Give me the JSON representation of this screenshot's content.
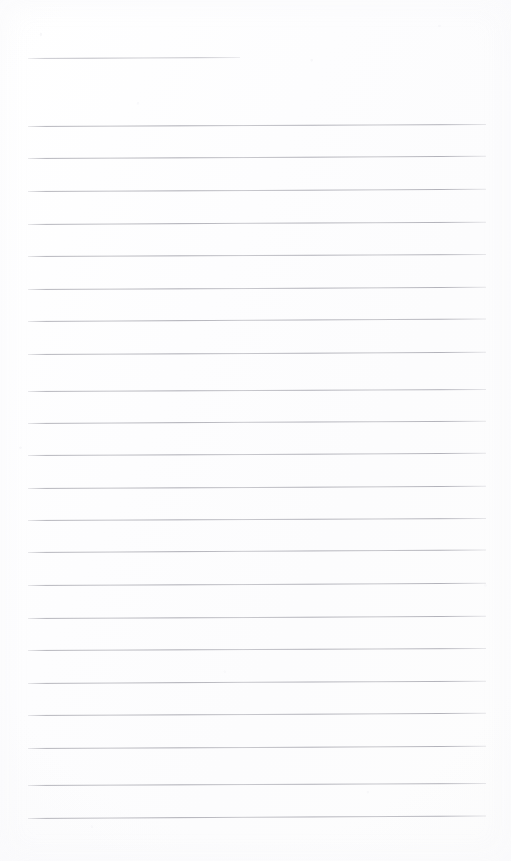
{
  "document": {
    "kind": "scanned-lined-paper",
    "title": "",
    "page_width": 511,
    "page_height": 861,
    "background_color": "#fdfdfd",
    "rule_color": "#b4b4bb",
    "visible_text": "",
    "content_note": ""
  },
  "ruling": {
    "line_count": 24,
    "left_margin_x": 28,
    "right_edge_x": 486,
    "line_spacing": 32.4,
    "line_thickness": 1,
    "skew_degrees": -0.28,
    "first_line_is_short": true,
    "short_line_right_x": 240
  },
  "lines": [
    {
      "index": 1,
      "y": 58,
      "x": 28,
      "width": 212,
      "short": true,
      "skew": -0.3
    },
    {
      "index": 2,
      "y": 126,
      "x": 28,
      "width": 458,
      "short": false,
      "skew": -0.26
    },
    {
      "index": 3,
      "y": 158,
      "x": 28,
      "width": 458,
      "short": false,
      "skew": -0.28
    },
    {
      "index": 4,
      "y": 191,
      "x": 28,
      "width": 458,
      "short": false,
      "skew": -0.27
    },
    {
      "index": 5,
      "y": 224,
      "x": 28,
      "width": 458,
      "short": false,
      "skew": -0.29
    },
    {
      "index": 6,
      "y": 256,
      "x": 28,
      "width": 458,
      "short": false,
      "skew": -0.26
    },
    {
      "index": 7,
      "y": 289,
      "x": 28,
      "width": 458,
      "short": false,
      "skew": -0.28
    },
    {
      "index": 8,
      "y": 321,
      "x": 28,
      "width": 458,
      "short": false,
      "skew": -0.3
    },
    {
      "index": 9,
      "y": 354,
      "x": 28,
      "width": 458,
      "short": false,
      "skew": -0.27
    },
    {
      "index": 10,
      "y": 391,
      "x": 28,
      "width": 458,
      "short": false,
      "skew": -0.26
    },
    {
      "index": 11,
      "y": 423,
      "x": 28,
      "width": 458,
      "short": false,
      "skew": -0.29
    },
    {
      "index": 12,
      "y": 455,
      "x": 28,
      "width": 458,
      "short": false,
      "skew": -0.27
    },
    {
      "index": 13,
      "y": 488,
      "x": 28,
      "width": 458,
      "short": false,
      "skew": -0.28
    },
    {
      "index": 14,
      "y": 520,
      "x": 28,
      "width": 458,
      "short": false,
      "skew": -0.26
    },
    {
      "index": 15,
      "y": 552,
      "x": 28,
      "width": 458,
      "short": false,
      "skew": -0.3
    },
    {
      "index": 16,
      "y": 585,
      "x": 28,
      "width": 458,
      "short": false,
      "skew": -0.27
    },
    {
      "index": 17,
      "y": 618,
      "x": 28,
      "width": 458,
      "short": false,
      "skew": -0.28
    },
    {
      "index": 18,
      "y": 650,
      "x": 28,
      "width": 458,
      "short": false,
      "skew": -0.26
    },
    {
      "index": 19,
      "y": 683,
      "x": 28,
      "width": 458,
      "short": false,
      "skew": -0.29
    },
    {
      "index": 20,
      "y": 715,
      "x": 28,
      "width": 458,
      "short": false,
      "skew": -0.27
    },
    {
      "index": 21,
      "y": 748,
      "x": 28,
      "width": 458,
      "short": false,
      "skew": -0.28
    },
    {
      "index": 22,
      "y": 785,
      "x": 28,
      "width": 458,
      "short": false,
      "skew": -0.26
    },
    {
      "index": 23,
      "y": 818,
      "x": 28,
      "width": 458,
      "short": false,
      "skew": -0.3
    }
  ]
}
